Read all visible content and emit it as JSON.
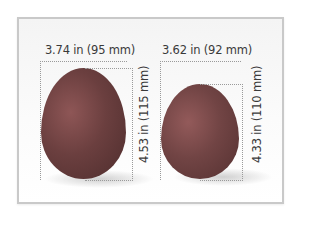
{
  "diagram": {
    "type": "size-comparison",
    "background_color": "#ffffff",
    "card_border_color": "#c9c9c9",
    "items": [
      {
        "name": "large-egg",
        "width_label": "3.74 in (95 mm)",
        "height_label": "4.53 in (115 mm)",
        "color": "#6b3f3f"
      },
      {
        "name": "smaller-egg",
        "width_label": "3.62 in (92 mm)",
        "height_label": "4.33 in (110 mm)",
        "color": "#714444"
      }
    ]
  }
}
